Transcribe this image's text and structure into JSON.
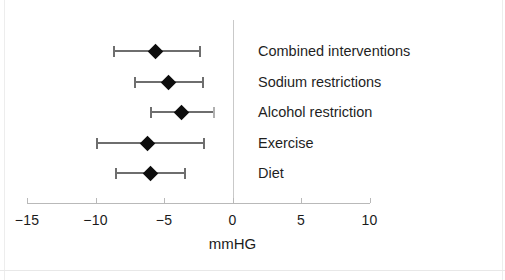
{
  "figure": {
    "background": "#ffffff",
    "point_color": "#0d0d0d",
    "line_color": "#6e6e6e",
    "axis_color": "#b9b9b9",
    "zero_line_color": "#c9c9c9"
  },
  "chart_data": {
    "type": "scatter",
    "subtype": "forest-plot",
    "title": "",
    "xlabel": "mmHG",
    "ylabel": "",
    "xlim": [
      -15,
      10
    ],
    "xticks": [
      -15,
      -10,
      -5,
      0,
      5,
      10
    ],
    "xtick_labels": [
      "−15",
      "−10",
      "−5",
      "0",
      "5",
      "10"
    ],
    "grid": false,
    "legend": null,
    "reference_line": 0,
    "categories": [
      "Combined interventions",
      "Sodium restrictions",
      "Alcohol restriction",
      "Exercise",
      "Diet"
    ],
    "values": [
      -5.6,
      -4.7,
      -3.7,
      -6.2,
      -6.0
    ],
    "ci_low": [
      -8.7,
      -7.2,
      -6.0,
      -10.0,
      -8.6
    ],
    "ci_high": [
      -2.3,
      -2.1,
      -1.3,
      -2.0,
      -3.4
    ],
    "points": [
      {
        "label": "Combined interventions",
        "estimate": -5.6,
        "ci_low": -8.7,
        "ci_high": -2.3
      },
      {
        "label": "Sodium restrictions",
        "estimate": -4.7,
        "ci_low": -7.2,
        "ci_high": -2.1
      },
      {
        "label": "Alcohol restriction",
        "estimate": -3.7,
        "ci_low": -6.0,
        "ci_high": -1.3
      },
      {
        "label": "Exercise",
        "estimate": -6.2,
        "ci_low": -10.0,
        "ci_high": -2.0
      },
      {
        "label": "Diet",
        "estimate": -6.0,
        "ci_low": -8.6,
        "ci_high": -3.4
      }
    ]
  },
  "axis": {
    "title": "mmHG",
    "tick_labels": [
      "−15",
      "−10",
      "−5",
      "0",
      "5",
      "10"
    ]
  },
  "rows": [
    {
      "label": "Combined interventions"
    },
    {
      "label": "Sodium restrictions"
    },
    {
      "label": "Alcohol restriction"
    },
    {
      "label": "Exercise"
    },
    {
      "label": "Diet"
    }
  ]
}
